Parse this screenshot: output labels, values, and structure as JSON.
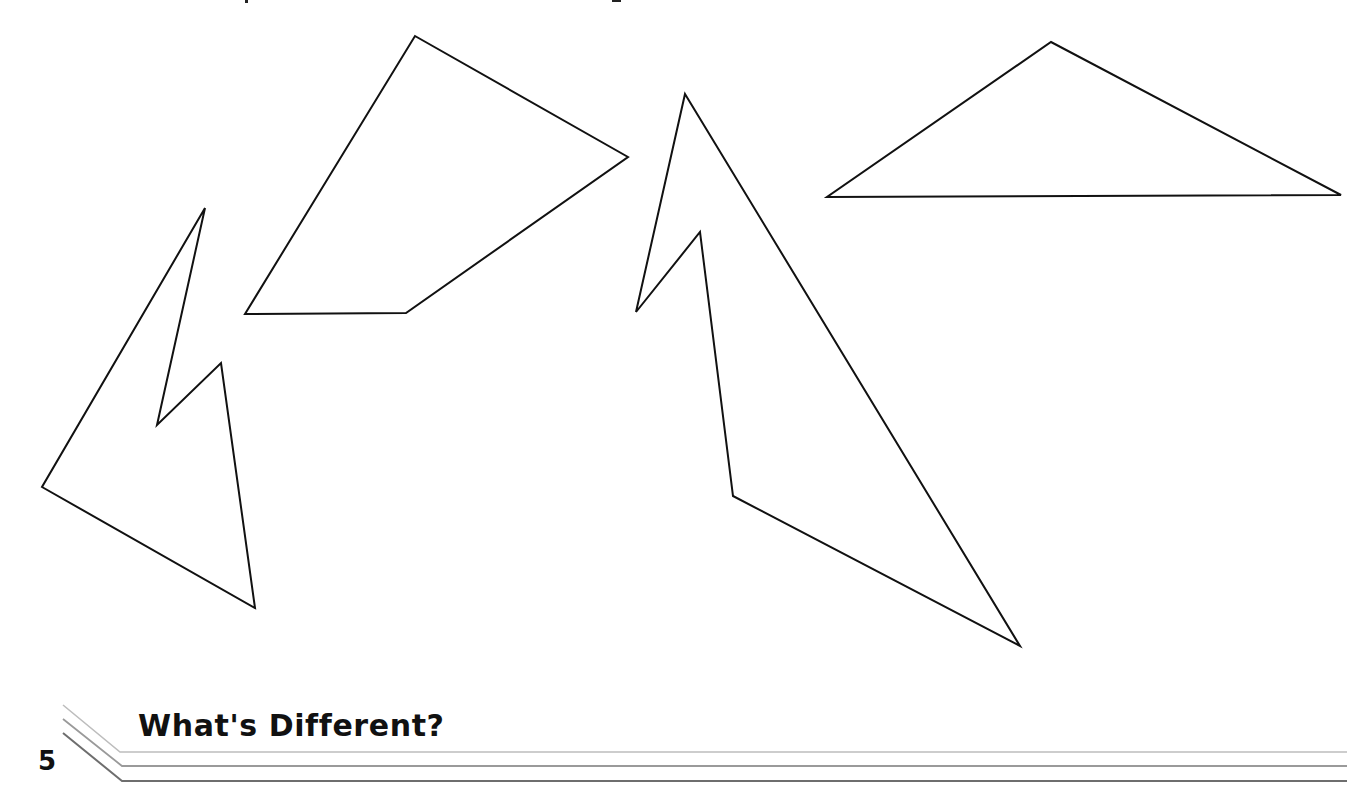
{
  "page": {
    "background": "#ffffff",
    "stroke_color": "#111111"
  },
  "footer": {
    "page_number": "5",
    "section_title": "What's Different?",
    "rule_colors": [
      "#bdbdbd",
      "#9a9a9a",
      "#6e6e6e"
    ]
  },
  "figures": {
    "shapes": [
      {
        "name": "quadrilateral",
        "points": "415,36 628,157 406,313 245,314"
      },
      {
        "name": "left-concave-polygon",
        "points": "205,208 157,425 221,363 255,608 42,487"
      },
      {
        "name": "middle-concave-polygon",
        "points": "685,94 1020,646 733,496 700,232 636,312"
      },
      {
        "name": "obtuse-triangle",
        "points": "1051,42 1341,195 827,197"
      }
    ]
  }
}
